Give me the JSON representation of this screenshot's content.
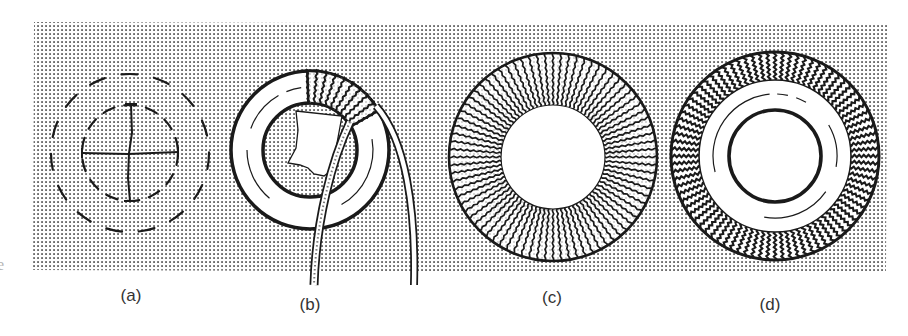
{
  "figure": {
    "background_color": "#ffffff",
    "stipple": {
      "dot_color": "#555555",
      "spacing": 4,
      "dot_size": 1.6,
      "region": {
        "tl": [
          34,
          22
        ],
        "tr": [
          887,
          25
        ],
        "br": [
          886,
          273
        ],
        "bl": [
          33,
          270
        ]
      }
    },
    "ink_color": "#1a1a1a",
    "edge_fragment": "e"
  },
  "panels": [
    {
      "id": "a",
      "label": "(a)",
      "label_pos": [
        131,
        300
      ],
      "content": "Two concentric dashed circles with a cross marking the centre",
      "center": [
        130,
        153
      ],
      "outer_dashed_radius": 79,
      "inner_dashed_radius": 48,
      "cross": {
        "h": [
          82,
          178
        ],
        "v": [
          104,
          201
        ]
      }
    },
    {
      "id": "b",
      "label": "(b)",
      "label_pos": [
        310,
        309
      ],
      "content": "Cut-out ring with a strip being wrapped around it; partially wound segment at top; torn paper in centre",
      "center": [
        310,
        150
      ],
      "outer_radius": 79,
      "inner_radius": 47,
      "wrapped_arc_degrees": [
        -92,
        -30
      ],
      "wrap_count": 9
    },
    {
      "id": "c",
      "label": "(c)",
      "label_pos": [
        552,
        302
      ],
      "content": "Ring fully wrapped with strip, radial windings around white centre",
      "center": [
        553,
        157
      ],
      "outer_radius": 104,
      "inner_radius": 52,
      "spoke_count": 80
    },
    {
      "id": "d",
      "label": "(d)",
      "label_pos": [
        770,
        309
      ],
      "content": "Finished ring: wrapped outer band, white inner ring with thin arcs, thick inner circle",
      "center": [
        775,
        156
      ],
      "outer_radius": 104,
      "band_inner_radius": 76,
      "thin_arc_radius": 62,
      "inner_circle_radius": 46,
      "spoke_count": 84
    }
  ]
}
